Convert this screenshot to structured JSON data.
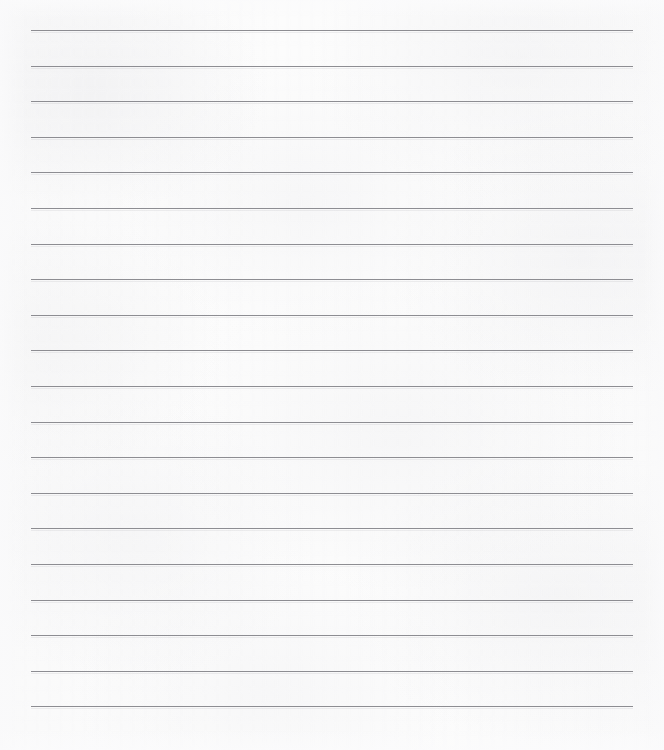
{
  "document": {
    "type": "lined-paper-scan",
    "title": "Blank ruled writing paper",
    "width": 664,
    "height": 750,
    "background_color": "#fcfcfc",
    "page_color": "#fdfdfd",
    "content_text": "",
    "has_text": false,
    "has_header": false,
    "has_page_number": false,
    "has_margin_rule": false
  },
  "ruling": {
    "line_color": "#8d8d92",
    "line_thickness_px": 1.3,
    "line_left_px": 31,
    "line_right_px": 633,
    "line_length_px": 602,
    "first_line_y_px": 30,
    "line_spacing_px": 35.6,
    "line_count": 20,
    "orientation": "horizontal",
    "lines_y_px": [
      30,
      65.6,
      101.2,
      136.8,
      172.4,
      208,
      243.6,
      279.2,
      314.8,
      350.4,
      386,
      421.6,
      457.2,
      492.8,
      528.4,
      564,
      599.6,
      635.2,
      670.8,
      706.4
    ]
  }
}
